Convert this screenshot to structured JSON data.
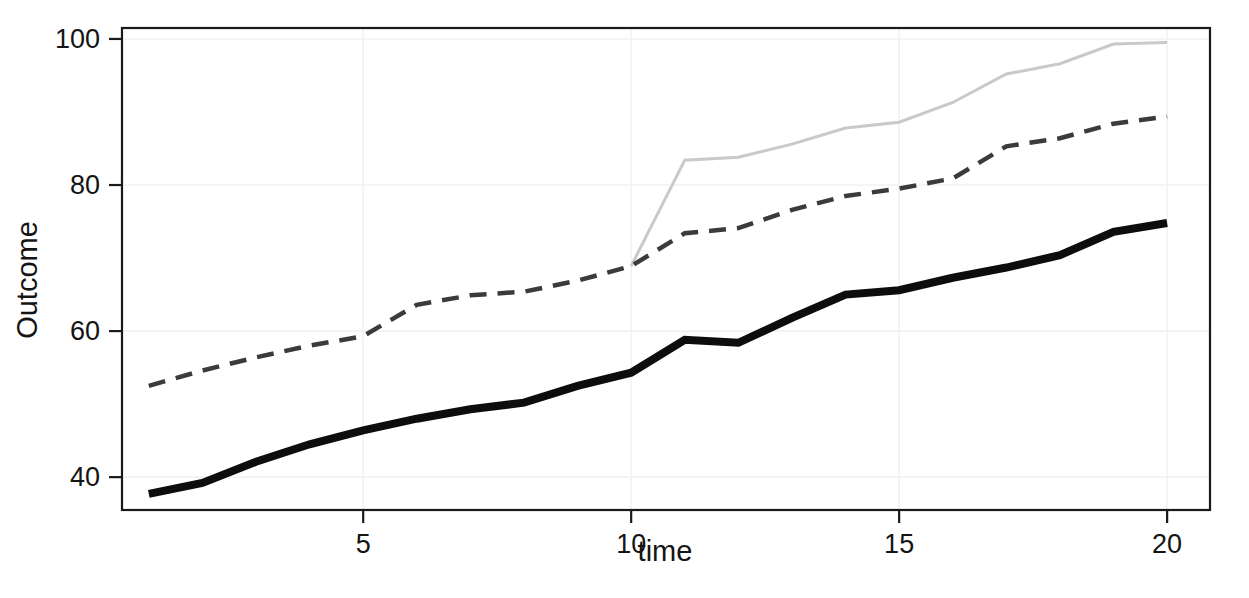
{
  "chart_data": {
    "type": "line",
    "title": "",
    "subtitle": "",
    "xlabel": "time",
    "ylabel": "Outcome",
    "xlim": [
      0.5,
      20.8
    ],
    "ylim": [
      35.5,
      101.5
    ],
    "xticks": [
      5,
      10,
      15,
      20
    ],
    "yticks": [
      40,
      60,
      80,
      100
    ],
    "xtick_labels": [
      "5",
      "10",
      "15",
      "20"
    ],
    "ytick_labels": [
      "40",
      "60",
      "80",
      "100"
    ],
    "grid": true,
    "grid_color": "#f2f2f2",
    "legend": "none",
    "background": "#ffffff",
    "panel_border_color": "#1a1a1a",
    "x": [
      1,
      2,
      3,
      4,
      5,
      6,
      7,
      8,
      9,
      10,
      11,
      12,
      13,
      14,
      15,
      16,
      17,
      18,
      19,
      20
    ],
    "series": [
      {
        "name": "solid-thick-black",
        "style": "solid",
        "color": "#0d0d0d",
        "width": 8,
        "x": [
          1,
          2,
          3,
          4,
          5,
          6,
          7,
          8,
          9,
          10,
          11,
          12,
          13,
          14,
          15,
          16,
          17,
          18,
          19,
          20
        ],
        "values": [
          37.7,
          39.2,
          42.1,
          44.5,
          46.4,
          48.0,
          49.3,
          50.2,
          52.5,
          54.3,
          58.8,
          58.4,
          61.8,
          65.0,
          65.6,
          67.3,
          68.7,
          70.4,
          73.6,
          74.8
        ]
      },
      {
        "name": "dashed-dark-gray",
        "style": "dashed",
        "color": "#3b3b3b",
        "width": 4.5,
        "dash": "17 11",
        "x": [
          1,
          2,
          3,
          4,
          5,
          6,
          7,
          8,
          9,
          10,
          11,
          12,
          13,
          14,
          15,
          16,
          17,
          18,
          19,
          20
        ],
        "values": [
          52.5,
          54.6,
          56.4,
          58.0,
          59.3,
          63.6,
          64.9,
          65.4,
          66.9,
          68.9,
          73.4,
          74.1,
          76.6,
          78.5,
          79.5,
          80.9,
          85.3,
          86.4,
          88.4,
          89.4
        ]
      },
      {
        "name": "solid-thin-light-gray",
        "style": "solid",
        "color": "#c9c9c9",
        "width": 3,
        "x": [
          10,
          11,
          12,
          13,
          14,
          15,
          16,
          17,
          18,
          19,
          20
        ],
        "values": [
          68.9,
          83.4,
          83.8,
          85.6,
          87.8,
          88.6,
          91.3,
          95.2,
          96.6,
          99.3,
          99.5
        ]
      }
    ]
  },
  "axes": {
    "x_title": "time",
    "y_title": "Outcome"
  }
}
